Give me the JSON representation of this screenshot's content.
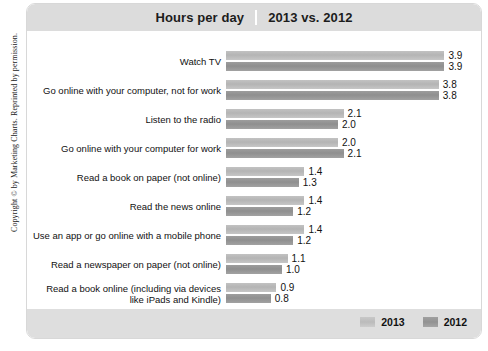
{
  "copyright": "Copyright © by Marketing Charts. Reprinted by permission.",
  "header": {
    "title": "Hours per day",
    "subtitle": "2013 vs. 2012"
  },
  "legend": {
    "items": [
      {
        "label": "2013",
        "color": "#bbbbbb"
      },
      {
        "label": "2012",
        "color": "#929292"
      }
    ]
  },
  "chart_data": {
    "type": "bar",
    "orientation": "horizontal",
    "title": "Hours per day",
    "subtitle": "2013 vs. 2012",
    "xlabel": "",
    "ylabel": "",
    "xlim": [
      0,
      4.0
    ],
    "grid": false,
    "legend_position": "bottom-right",
    "categories": [
      "Watch TV",
      "Go online with your computer, not for work",
      "Listen to the radio",
      "Go online with your computer for work",
      "Read a book on paper (not online)",
      "Read the news online",
      "Use an app or go online with a mobile phone",
      "Read a newspaper on paper (not online)",
      "Read a book online (including via devices\nlike iPads and Kindle)"
    ],
    "series": [
      {
        "name": "2013",
        "color": "#bbbbbb",
        "values": [
          3.9,
          3.8,
          2.1,
          2.0,
          1.4,
          1.4,
          1.4,
          1.1,
          0.9
        ],
        "labels": [
          "3.9",
          "3.8",
          "2.1",
          "2.0",
          "1.4",
          "1.4",
          "1.4",
          "1.1",
          "0.9"
        ]
      },
      {
        "name": "2012",
        "color": "#929292",
        "values": [
          3.9,
          3.8,
          2.0,
          2.1,
          1.3,
          1.2,
          1.2,
          1.0,
          0.8
        ],
        "labels": [
          "3.9",
          "3.8",
          "2.0",
          "2.1",
          "1.3",
          "1.2",
          "1.2",
          "1.0",
          "0.8"
        ]
      }
    ]
  }
}
